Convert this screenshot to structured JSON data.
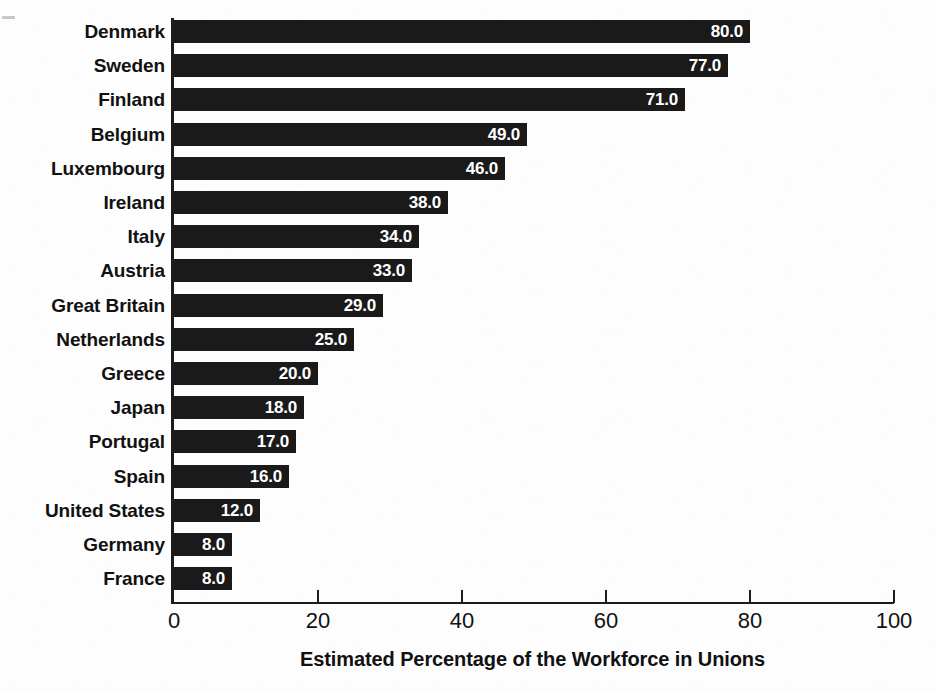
{
  "chart_data": {
    "type": "bar",
    "orientation": "horizontal",
    "title": "",
    "xlabel": "Estimated Percentage of the Workforce in Unions",
    "ylabel": "",
    "xlim": [
      0,
      100
    ],
    "xticks": [
      "0",
      "20",
      "40",
      "60",
      "80",
      "100"
    ],
    "xtick_values": [
      0,
      20,
      40,
      60,
      80,
      100
    ],
    "grid": false,
    "legend": null,
    "bar_color": "#1a1a1a",
    "value_label_color": "#ffffff",
    "value_label_format": "one-decimal",
    "categories": [
      "Denmark",
      "Sweden",
      "Finland",
      "Belgium",
      "Luxembourg",
      "Ireland",
      "Italy",
      "Austria",
      "Great Britain",
      "Netherlands",
      "Greece",
      "Japan",
      "Portugal",
      "Spain",
      "United States",
      "Germany",
      "France"
    ],
    "values": [
      80.0,
      77.0,
      71.0,
      49.0,
      46.0,
      38.0,
      34.0,
      33.0,
      29.0,
      25.0,
      20.0,
      18.0,
      17.0,
      16.0,
      12.0,
      8.0,
      8.0
    ],
    "value_labels": [
      "80.0",
      "77.0",
      "71.0",
      "49.0",
      "46.0",
      "38.0",
      "34.0",
      "33.0",
      "29.0",
      "25.0",
      "20.0",
      "18.0",
      "17.0",
      "16.0",
      "12.0",
      "8.0",
      "8.0"
    ],
    "bars": [
      {
        "category": "Denmark",
        "value": 80.0,
        "label": "80.0"
      },
      {
        "category": "Sweden",
        "value": 77.0,
        "label": "77.0"
      },
      {
        "category": "Finland",
        "value": 71.0,
        "label": "71.0"
      },
      {
        "category": "Belgium",
        "value": 49.0,
        "label": "49.0"
      },
      {
        "category": "Luxembourg",
        "value": 46.0,
        "label": "46.0"
      },
      {
        "category": "Ireland",
        "value": 38.0,
        "label": "38.0"
      },
      {
        "category": "Italy",
        "value": 34.0,
        "label": "34.0"
      },
      {
        "category": "Austria",
        "value": 33.0,
        "label": "33.0"
      },
      {
        "category": "Great Britain",
        "value": 29.0,
        "label": "29.0"
      },
      {
        "category": "Netherlands",
        "value": 25.0,
        "label": "25.0"
      },
      {
        "category": "Greece",
        "value": 20.0,
        "label": "20.0"
      },
      {
        "category": "Japan",
        "value": 18.0,
        "label": "18.0"
      },
      {
        "category": "Portugal",
        "value": 17.0,
        "label": "17.0"
      },
      {
        "category": "Spain",
        "value": 16.0,
        "label": "16.0"
      },
      {
        "category": "United States",
        "value": 12.0,
        "label": "12.0"
      },
      {
        "category": "Germany",
        "value": 8.0,
        "label": "8.0"
      },
      {
        "category": "France",
        "value": 8.0,
        "label": "8.0"
      }
    ]
  }
}
